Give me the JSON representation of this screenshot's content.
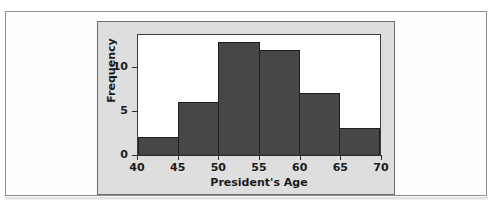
{
  "chart_data": {
    "type": "bar",
    "title": "",
    "xlabel": "President's Age",
    "ylabel": "Frequency",
    "categories": [
      "40-45",
      "45-50",
      "50-55",
      "55-60",
      "60-65",
      "65-70"
    ],
    "bin_edges": [
      40,
      45,
      50,
      55,
      60,
      65,
      70
    ],
    "values": [
      2,
      6,
      13,
      12,
      7,
      3
    ],
    "xlim": [
      40,
      70
    ],
    "ylim": [
      0,
      13.75
    ],
    "x_ticks": [
      40,
      45,
      50,
      55,
      60,
      65,
      70
    ],
    "y_ticks": [
      0,
      5,
      10
    ],
    "grid": false,
    "legend": null,
    "bar_color": "#474747",
    "bar_edge_color": "#1f1f1f",
    "plot_background": "#ffffff",
    "panel_background": "#dedede"
  },
  "figure": {
    "x_axis": {
      "label": "President's Age",
      "tick_labels": [
        "40",
        "45",
        "50",
        "55",
        "60",
        "65",
        "70"
      ]
    },
    "y_axis": {
      "label": "Frequency",
      "tick_labels": [
        "0",
        "5",
        "10"
      ]
    }
  }
}
